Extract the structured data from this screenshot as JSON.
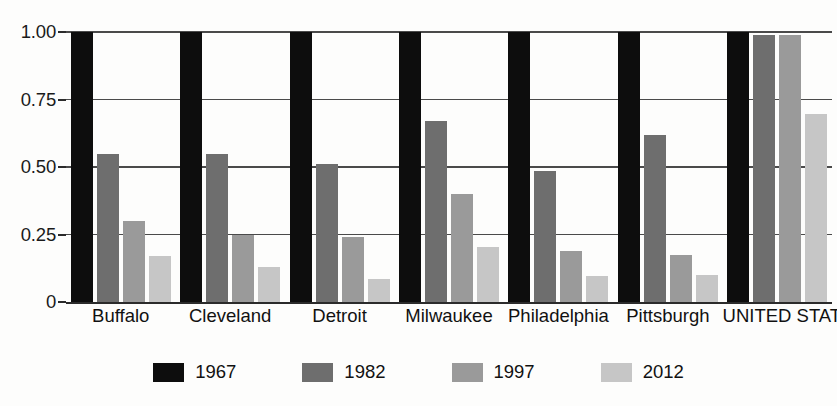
{
  "chart_data": {
    "type": "bar",
    "title": "",
    "subtitle": "",
    "xlabel": "",
    "ylabel": "",
    "ylim": [
      0,
      1.0
    ],
    "grid": true,
    "legend_position": "bottom",
    "categories": [
      "Buffalo",
      "Cleveland",
      "Detroit",
      "Milwaukee",
      "Philadelphia",
      "Pittsburgh",
      "UNITED STATES"
    ],
    "series": [
      {
        "name": "1967",
        "color": "#0d0d0d",
        "values": [
          1.0,
          1.0,
          1.0,
          1.0,
          1.0,
          1.0,
          1.0
        ]
      },
      {
        "name": "1982",
        "color": "#6e6e6e",
        "values": [
          0.55,
          0.55,
          0.51,
          0.67,
          0.485,
          0.62,
          0.99
        ]
      },
      {
        "name": "1997",
        "color": "#9a9a9a",
        "values": [
          0.3,
          0.25,
          0.24,
          0.4,
          0.19,
          0.175,
          0.99
        ]
      },
      {
        "name": "2012",
        "color": "#c6c6c6",
        "values": [
          0.17,
          0.13,
          0.085,
          0.205,
          0.095,
          0.1,
          0.695
        ]
      }
    ],
    "y_ticks": [
      {
        "value": 1.0,
        "label": "1.00"
      },
      {
        "value": 0.75,
        "label": "0.75"
      },
      {
        "value": 0.5,
        "label": "0.50"
      },
      {
        "value": 0.25,
        "label": "0.25"
      },
      {
        "value": 0.0,
        "label": "0"
      }
    ],
    "legend": [
      {
        "label": "1967",
        "color": "#0d0d0d"
      },
      {
        "label": "1982",
        "color": "#6e6e6e"
      },
      {
        "label": "1997",
        "color": "#9a9a9a"
      },
      {
        "label": "2012",
        "color": "#c6c6c6"
      }
    ]
  }
}
